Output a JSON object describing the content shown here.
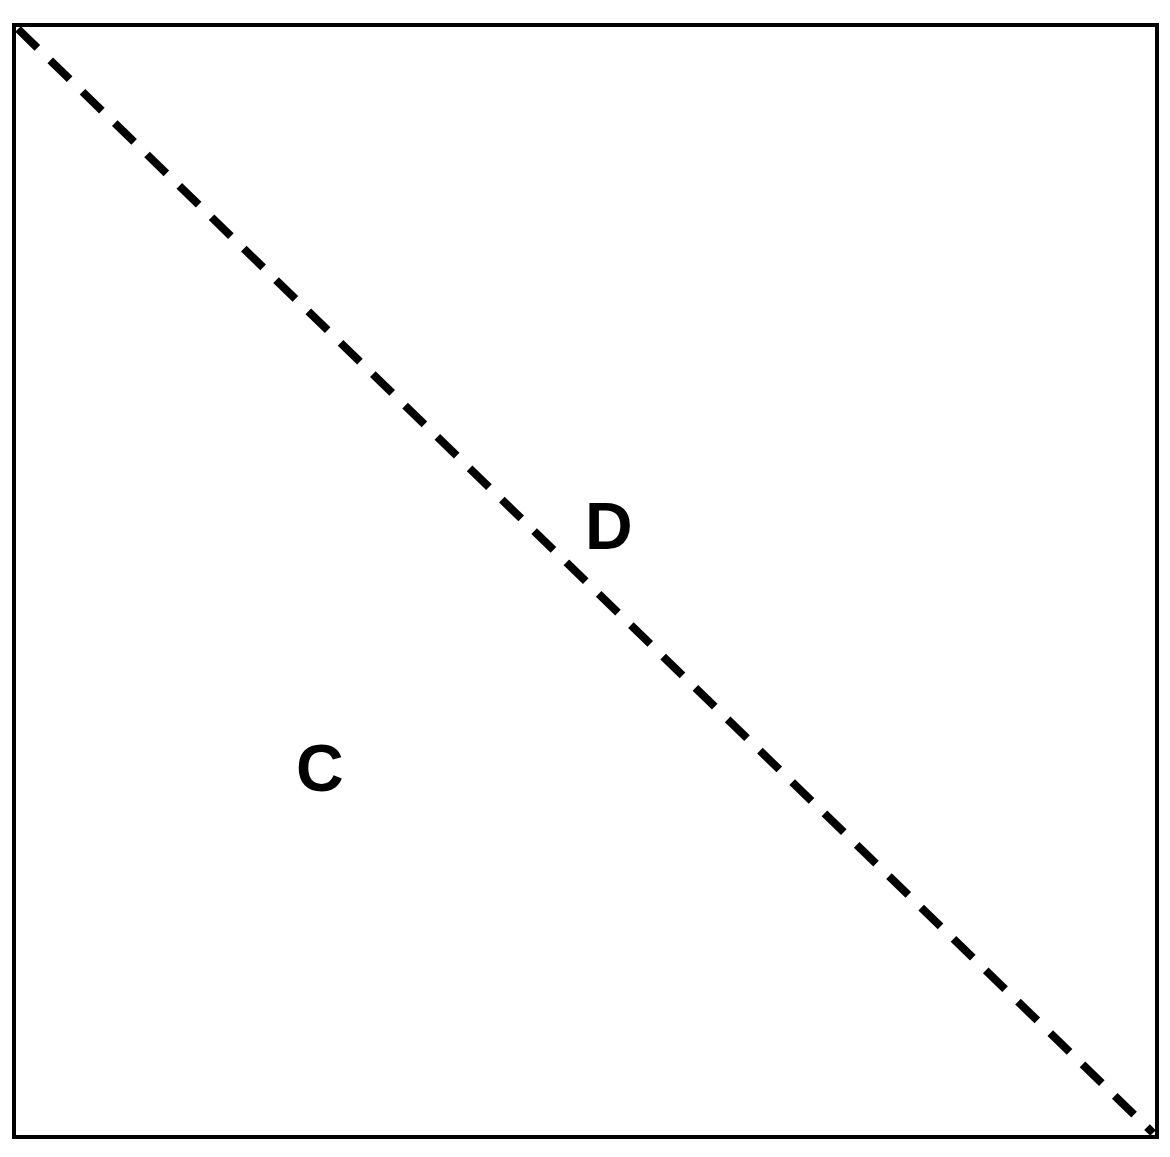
{
  "figure": {
    "background_color": "#ffffff",
    "stroke_color": "#000000",
    "canvas": {
      "width": 1170,
      "height": 1157
    },
    "border": {
      "name": "outer-rectangle",
      "x": 14,
      "y": 25,
      "width": 1143,
      "height": 1112,
      "stroke_width": 4
    },
    "diagonal": {
      "name": "dashed-diagonal",
      "x1": 18,
      "y1": 29,
      "x2": 1153,
      "y2": 1133,
      "stroke_width": 8,
      "dash_length": 27,
      "dash_gap": 18,
      "style": "dashed"
    },
    "labels": [
      {
        "id": "label-d",
        "text": "D",
        "x": 585,
        "y": 549,
        "font_size": 66,
        "weight": "bold",
        "region": "upper-right"
      },
      {
        "id": "label-c",
        "text": "C",
        "x": 296,
        "y": 791,
        "font_size": 66,
        "weight": "bold",
        "region": "lower-left"
      }
    ]
  }
}
